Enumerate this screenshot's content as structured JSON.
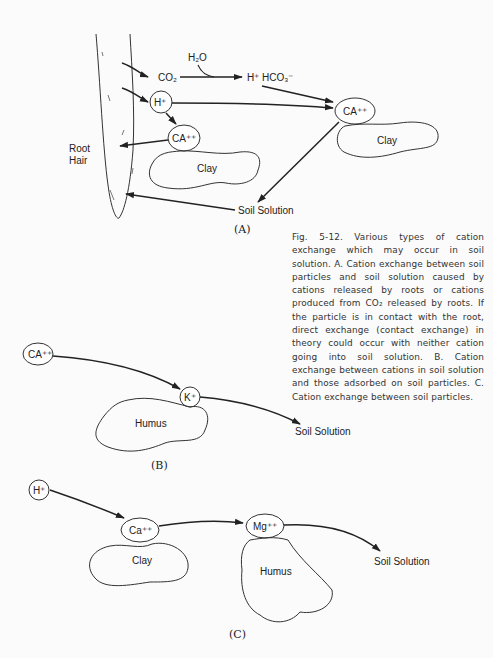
{
  "panel_a": {
    "label": "(A)",
    "root_hair_label_1": "Root",
    "root_hair_label_2": "Hair",
    "h2o": "H₂O",
    "co2": "CO₂",
    "h_plus_hco3": "H⁺  HCO₃⁻",
    "h_plus": "H⁺",
    "ca_left": "CA⁺⁺",
    "ca_right": "CA⁺⁺",
    "clay_left": "Clay",
    "clay_right": "Clay",
    "soil_solution": "Soil Solution"
  },
  "panel_b": {
    "label": "(B)",
    "ca": "CA⁺⁺",
    "k": "K⁺",
    "humus": "Humus",
    "soil_solution": "Soil Solution"
  },
  "panel_c": {
    "label": "(C)",
    "h": "H⁺",
    "ca": "Ca⁺⁺",
    "mg": "Mg⁺⁺",
    "clay": "Clay",
    "humus": "Humus",
    "soil_solution": "Soil Solution"
  },
  "caption": {
    "text": "Fig. 5-12. Various types of cation exchange which may occur in soil solution. A. Cation exchange between soil particles and soil solution caused by cations released by roots or cations produced from CO₂ released by roots. If the particle is in contact with the root, direct exchange (contact exchange) in theory could occur with neither cation going into soil solution. B. Cation exchange between cations in soil solution and those adsorbed on soil particles. C. Cation exchange between soil particles."
  }
}
